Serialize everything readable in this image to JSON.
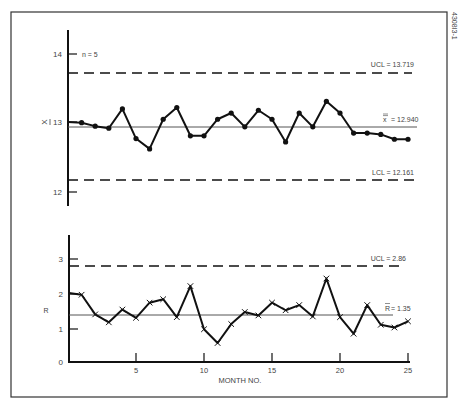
{
  "figure_id": "4308I3-1",
  "chart_data": [
    {
      "type": "line",
      "title": "X-bar control chart",
      "subtitle": "n = 5",
      "xlabel": "",
      "ylabel": "X̄",
      "ylim": [
        11.9,
        14.5
      ],
      "yticks": [
        12,
        13,
        14
      ],
      "x": [
        1,
        2,
        3,
        4,
        5,
        6,
        7,
        8,
        9,
        10,
        11,
        12,
        13,
        14,
        15,
        16,
        17,
        18,
        19,
        20,
        21,
        22,
        23,
        24,
        25
      ],
      "series": [
        {
          "name": "X̄",
          "marker": "dot",
          "style": "solid",
          "values": [
            12.99,
            12.94,
            12.91,
            13.19,
            12.76,
            12.61,
            13.04,
            13.21,
            12.8,
            12.8,
            13.04,
            13.13,
            12.93,
            13.17,
            13.04,
            12.71,
            13.13,
            12.93,
            13.3,
            13.13,
            12.84,
            12.84,
            12.82,
            12.75,
            12.75
          ]
        }
      ],
      "start_value": 13.0,
      "reference_lines": [
        {
          "name": "UCL",
          "value": 13.719,
          "label": "UCL = 13.719",
          "style": "dashed"
        },
        {
          "name": "center",
          "value": 12.94,
          "label": "x̿ = 12.940",
          "style": "solid"
        },
        {
          "name": "LCL",
          "value": 12.161,
          "label": "LCL = 12.161",
          "style": "dashed"
        }
      ],
      "grid": false
    },
    {
      "type": "line",
      "title": "R control chart",
      "xlabel": "MONTH NO.",
      "ylabel": "R",
      "ylim": [
        0,
        3.5
      ],
      "yticks": [
        0,
        1,
        2,
        3
      ],
      "xticks": [
        5,
        10,
        15,
        20,
        25
      ],
      "x": [
        1,
        2,
        3,
        4,
        5,
        6,
        7,
        8,
        9,
        10,
        11,
        12,
        13,
        14,
        15,
        16,
        17,
        18,
        19,
        20,
        21,
        22,
        23,
        24,
        25
      ],
      "series": [
        {
          "name": "R",
          "marker": "x",
          "style": "solid/dashed",
          "values": [
            1.95,
            1.38,
            1.15,
            1.52,
            1.28,
            1.72,
            1.82,
            1.3,
            2.2,
            0.95,
            0.55,
            1.1,
            1.45,
            1.35,
            1.72,
            1.5,
            1.65,
            1.32,
            2.42,
            1.3,
            0.82,
            1.65,
            1.08,
            1.0,
            1.18
          ]
        }
      ],
      "start_value": 2.0,
      "reference_lines": [
        {
          "name": "UCL",
          "value": 2.86,
          "label": "UCL = 2.86",
          "style": "dashed"
        },
        {
          "name": "center",
          "value": 1.35,
          "label": "R̄ = 1.35",
          "style": "solid"
        }
      ],
      "grid": false
    }
  ],
  "labels": {
    "xbar_ylabel": "X",
    "n_label": "n = 5",
    "xbar_ucl": "UCL = 13.719",
    "xbar_center": "= 12.940",
    "xbar_center_sym": "x",
    "xbar_lcl": "LCL = 12.161",
    "r_ylabel": "R",
    "r_ucl": "UCL = 2.86",
    "r_center": "= 1.35",
    "r_center_sym": "R",
    "xlabel": "MONTH NO.",
    "figure_id": "4308I3-1"
  },
  "ticks": {
    "xbar_y": [
      "14",
      "13",
      "12"
    ],
    "r_y": [
      "3",
      "2",
      "1",
      "0"
    ],
    "x": [
      "5",
      "10",
      "15",
      "20",
      "25"
    ]
  }
}
